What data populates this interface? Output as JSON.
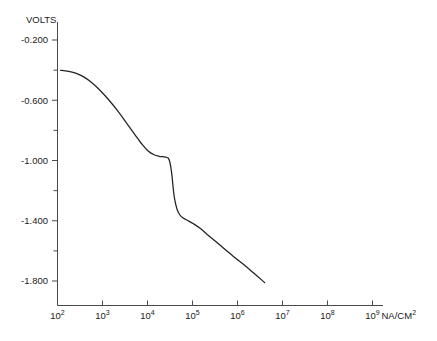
{
  "chart_data": {
    "type": "line",
    "title": "",
    "xlabel": "NA/CM2",
    "ylabel": "VOLTS",
    "xscale": "log",
    "xlim": [
      100,
      1000000000
    ],
    "ylim": [
      -2.0,
      -0.02
    ],
    "grid": false,
    "legend": null,
    "x_tick_labels": [
      "10^2",
      "10^3",
      "10^4",
      "10^5",
      "10^6",
      "10^7",
      "10^8",
      "10^9"
    ],
    "x_tick_values": [
      100,
      1000,
      10000,
      100000,
      1000000,
      10000000,
      100000000,
      1000000000
    ],
    "y_tick_labels": [
      "-0.200",
      "-0.600",
      "-1.000",
      "-1.400",
      "-1.800"
    ],
    "y_tick_values": [
      -0.2,
      -0.6,
      -1.0,
      -1.4,
      -1.8
    ],
    "y_minor_tick_values": [
      -0.4,
      -0.8,
      -1.2,
      -1.6
    ],
    "series": [
      {
        "name": "polarization curve",
        "x": [
          117,
          150,
          200,
          280,
          400,
          600,
          900,
          1400,
          2200,
          3400,
          5200,
          7600,
          10500,
          14000,
          18000,
          22000,
          26000,
          29000,
          31000,
          33000,
          35000,
          37000,
          40000,
          45000,
          52000,
          62000,
          78000,
          105000,
          150000,
          230000,
          400000,
          800000,
          1800000,
          4000000
        ],
        "y": [
          -0.402,
          -0.405,
          -0.412,
          -0.425,
          -0.448,
          -0.487,
          -0.537,
          -0.6,
          -0.672,
          -0.75,
          -0.826,
          -0.893,
          -0.938,
          -0.962,
          -0.972,
          -0.975,
          -0.978,
          -0.985,
          -1.005,
          -1.045,
          -1.1,
          -1.175,
          -1.255,
          -1.32,
          -1.36,
          -1.382,
          -1.398,
          -1.42,
          -1.452,
          -1.5,
          -1.56,
          -1.635,
          -1.72,
          -1.81
        ]
      }
    ],
    "x_axis_unit_label": "NA/CM",
    "x_axis_unit_sup": "2"
  },
  "axes": {
    "y_axis_title": "VOLTS"
  }
}
